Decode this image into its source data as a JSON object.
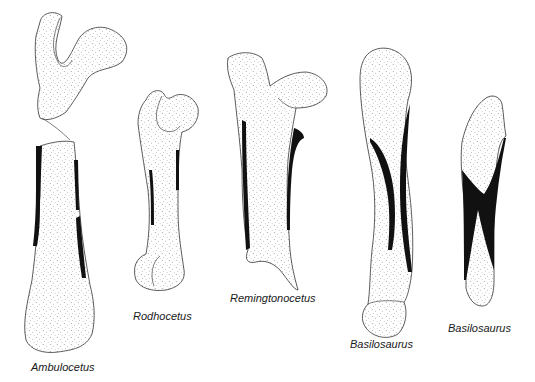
{
  "figure": {
    "type": "comparative-anatomy-illustration",
    "colors": {
      "background": "#ffffff",
      "stipple_fill": "#ffffff",
      "stipple_dots": "#555555",
      "outline": "#333333",
      "cortical_bone": "#111111",
      "label_text": "#1a1a1a"
    },
    "specimens": [
      {
        "id": "ambulocetus",
        "label": "Ambulocetus"
      },
      {
        "id": "rodhocetus",
        "label": "Rodhocetus"
      },
      {
        "id": "remingtonocetus",
        "label": "Remingtonocetus"
      },
      {
        "id": "basilosaurus-1",
        "label": "Basilosaurus"
      },
      {
        "id": "basilosaurus-2",
        "label": "Basilosaurus"
      }
    ]
  }
}
